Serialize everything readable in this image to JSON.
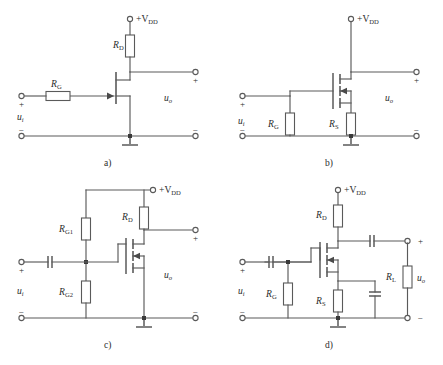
{
  "figure": {
    "panels": [
      {
        "id": "a",
        "caption": "a)",
        "supply_label": "+V",
        "supply_sub": "DD",
        "input_label": "u",
        "input_sub": "i",
        "output_label": "u",
        "output_sub": "o",
        "plus_sign": "+",
        "minus_sign": "−",
        "components": [
          {
            "name": "R",
            "sub": "D",
            "type": "resistor",
            "orientation": "vertical"
          },
          {
            "name": "R",
            "sub": "G",
            "type": "resistor",
            "orientation": "horizontal"
          }
        ],
        "device": "jfet-n-channel"
      },
      {
        "id": "b",
        "caption": "b)",
        "supply_label": "+V",
        "supply_sub": "DD",
        "input_label": "u",
        "input_sub": "i",
        "output_label": "u",
        "output_sub": "o",
        "plus_sign": "+",
        "minus_sign": "−",
        "components": [
          {
            "name": "R",
            "sub": "G",
            "type": "resistor",
            "orientation": "vertical"
          },
          {
            "name": "R",
            "sub": "S",
            "type": "resistor",
            "orientation": "vertical"
          }
        ],
        "device": "mosfet-n-channel"
      },
      {
        "id": "c",
        "caption": "c)",
        "supply_label": "+V",
        "supply_sub": "DD",
        "input_label": "u",
        "input_sub": "i",
        "output_label": "u",
        "output_sub": "o",
        "plus_sign": "+",
        "minus_sign": "−",
        "components": [
          {
            "name": "R",
            "sub": "G1",
            "type": "resistor",
            "orientation": "vertical"
          },
          {
            "name": "R",
            "sub": "G2",
            "type": "resistor",
            "orientation": "vertical"
          },
          {
            "name": "R",
            "sub": "D",
            "type": "resistor",
            "orientation": "vertical"
          },
          {
            "name": "C",
            "sub": "",
            "type": "capacitor",
            "orientation": "horizontal"
          }
        ],
        "device": "mosfet-n-channel"
      },
      {
        "id": "d",
        "caption": "d)",
        "supply_label": "+V",
        "supply_sub": "DD",
        "input_label": "u",
        "input_sub": "i",
        "output_label": "u",
        "output_sub": "o",
        "plus_sign": "+",
        "minus_sign": "−",
        "components": [
          {
            "name": "R",
            "sub": "D",
            "type": "resistor",
            "orientation": "vertical"
          },
          {
            "name": "R",
            "sub": "G",
            "type": "resistor",
            "orientation": "vertical"
          },
          {
            "name": "R",
            "sub": "S",
            "type": "resistor",
            "orientation": "vertical"
          },
          {
            "name": "R",
            "sub": "L",
            "type": "resistor",
            "orientation": "vertical"
          },
          {
            "name": "C",
            "sub": "",
            "type": "capacitor",
            "orientation": "horizontal"
          },
          {
            "name": "C",
            "sub": "",
            "type": "capacitor",
            "orientation": "vertical"
          }
        ],
        "device": "mosfet-n-channel"
      }
    ]
  },
  "colors": {
    "wire": "#5a5a5a",
    "text": "#2b2b2b",
    "background": "#ffffff",
    "node": "#3a3a3a"
  }
}
